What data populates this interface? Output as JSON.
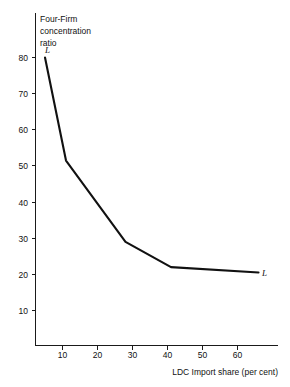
{
  "chart_data": {
    "type": "line",
    "title": "",
    "xlabel": "LDC Import share (per cent)",
    "ylabel": "Four-Firm concentration ratio",
    "ylabel_lines": [
      "Four-Firm",
      "concentration",
      "ratio"
    ],
    "xlim": [
      0,
      70
    ],
    "ylim": [
      0,
      85
    ],
    "xticks": [
      10,
      20,
      30,
      40,
      50,
      60
    ],
    "xtick_labels": [
      "10",
      "20",
      "30",
      "40",
      "50",
      "60"
    ],
    "yticks": [
      10,
      20,
      30,
      40,
      50,
      60,
      70,
      80
    ],
    "ytick_labels": [
      "10",
      "20",
      "30",
      "40",
      "50",
      "60",
      "70",
      "80"
    ],
    "grid": false,
    "legend": "none",
    "series": [
      {
        "name": "L",
        "start_label": "L",
        "end_label": "L",
        "color": "#111111",
        "x": [
          5,
          11,
          28,
          41,
          66
        ],
        "y": [
          80,
          51.5,
          29,
          22,
          20.5
        ]
      }
    ]
  },
  "annotations": {
    "start_marker": "L",
    "end_marker": "L"
  },
  "colors": {
    "background": "#ffffff",
    "axis": "#1a1a1a",
    "curve": "#111111",
    "text": "#111111"
  }
}
